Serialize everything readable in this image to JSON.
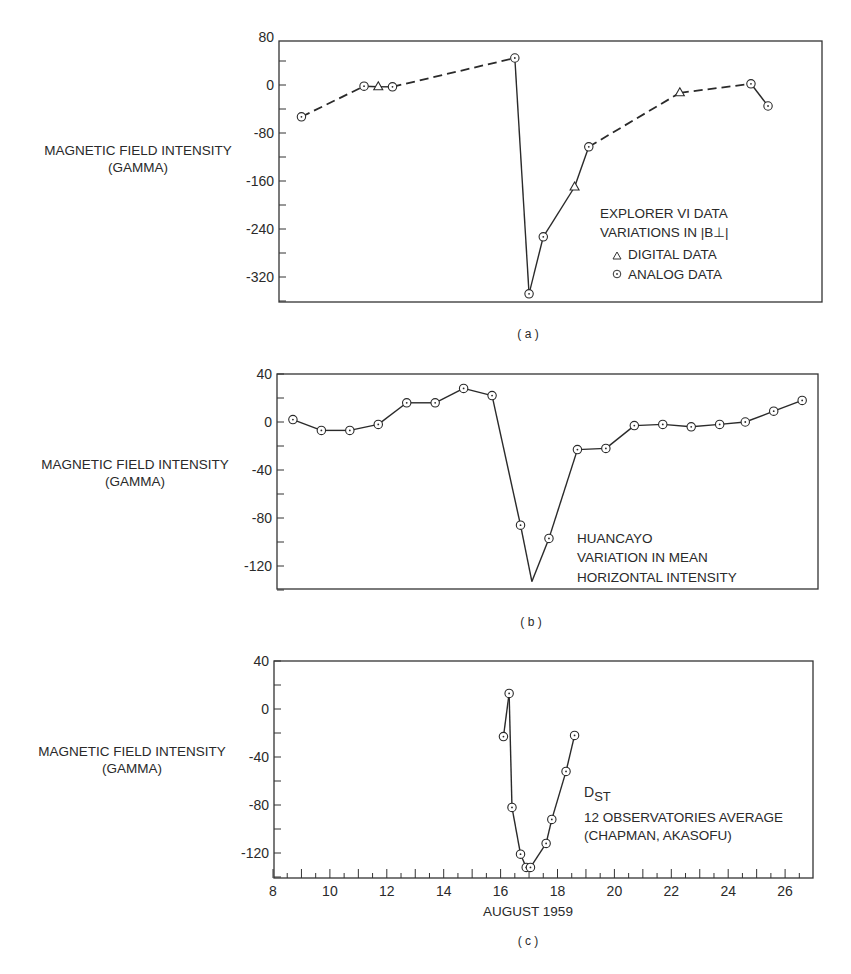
{
  "figure": {
    "x_axis_label": "AUGUST 1959",
    "x_ticks": [
      8,
      10,
      12,
      14,
      16,
      18,
      20,
      22,
      24,
      26
    ],
    "ylabel_line1": "MAGNETIC FIELD INTENSITY",
    "ylabel_line2": "(GAMMA)"
  },
  "panels": [
    {
      "id": "a",
      "caption": "( a )",
      "legend": {
        "line1": "EXPLORER VI DATA",
        "line2": "VARIATIONS IN |B⊥|",
        "digital_label": "DIGITAL DATA",
        "analog_label": "ANALOG DATA"
      }
    },
    {
      "id": "b",
      "caption": "( b )",
      "legend": {
        "line1": "HUANCAYO",
        "line2": "VARIATION IN MEAN",
        "line3": "HORIZONTAL INTENSITY"
      }
    },
    {
      "id": "c",
      "caption": "( c )",
      "legend": {
        "line1": "D",
        "line1_sub": "ST",
        "line2": "12 OBSERVATORIES AVERAGE",
        "line3": "(CHAPMAN, AKASOFU)"
      }
    }
  ],
  "chart_data": [
    {
      "type": "line",
      "title": "(a) Explorer VI data — variations in |B⊥|",
      "xlabel": "",
      "ylabel": "MAGNETIC FIELD INTENSITY (GAMMA)",
      "xlim": [
        8,
        27
      ],
      "ylim": [
        -360,
        80
      ],
      "yticks": [
        80,
        0,
        -80,
        -160,
        -240,
        -320
      ],
      "grid": false,
      "legend_position": "lower right inside",
      "series": [
        {
          "name": "Explorer VI |B⊥|",
          "points": [
            {
              "x": 9.0,
              "y": -53,
              "marker": "analog"
            },
            {
              "x": 11.2,
              "y": -2,
              "marker": "analog"
            },
            {
              "x": 11.7,
              "y": -3,
              "marker": "digital"
            },
            {
              "x": 12.2,
              "y": -3,
              "marker": "analog"
            },
            {
              "x": 16.5,
              "y": 45,
              "marker": "analog"
            },
            {
              "x": 17.0,
              "y": -348,
              "marker": "analog"
            },
            {
              "x": 17.5,
              "y": -253,
              "marker": "analog"
            },
            {
              "x": 18.6,
              "y": -170,
              "marker": "digital"
            },
            {
              "x": 19.1,
              "y": -103,
              "marker": "analog"
            },
            {
              "x": 22.3,
              "y": -13,
              "marker": "digital"
            },
            {
              "x": 24.8,
              "y": 2,
              "marker": "analog"
            },
            {
              "x": 25.4,
              "y": -35,
              "marker": "analog"
            }
          ],
          "segments": [
            {
              "from": 0,
              "to": 1,
              "style": "dashed"
            },
            {
              "from": 1,
              "to": 2,
              "style": "solid"
            },
            {
              "from": 2,
              "to": 3,
              "style": "solid"
            },
            {
              "from": 3,
              "to": 4,
              "style": "dashed"
            },
            {
              "from": 4,
              "to": 5,
              "style": "solid"
            },
            {
              "from": 5,
              "to": 6,
              "style": "solid"
            },
            {
              "from": 6,
              "to": 7,
              "style": "solid"
            },
            {
              "from": 7,
              "to": 8,
              "style": "solid"
            },
            {
              "from": 8,
              "to": 9,
              "style": "dashed"
            },
            {
              "from": 9,
              "to": 10,
              "style": "dashed"
            },
            {
              "from": 10,
              "to": 11,
              "style": "solid"
            }
          ]
        }
      ]
    },
    {
      "type": "line",
      "title": "(b) Huancayo variation in mean horizontal intensity",
      "xlabel": "",
      "ylabel": "MAGNETIC FIELD INTENSITY (GAMMA)",
      "xlim": [
        8,
        27
      ],
      "ylim": [
        -140,
        40
      ],
      "yticks": [
        40,
        0,
        -40,
        -80,
        -120
      ],
      "grid": false,
      "series": [
        {
          "name": "Huancayo H",
          "points": [
            {
              "x": 8.7,
              "y": 2,
              "marker": "analog"
            },
            {
              "x": 9.7,
              "y": -7,
              "marker": "analog"
            },
            {
              "x": 10.7,
              "y": -7,
              "marker": "analog"
            },
            {
              "x": 11.7,
              "y": -2,
              "marker": "analog"
            },
            {
              "x": 12.7,
              "y": 16,
              "marker": "analog"
            },
            {
              "x": 13.7,
              "y": 16,
              "marker": "analog"
            },
            {
              "x": 14.7,
              "y": 28,
              "marker": "analog"
            },
            {
              "x": 15.7,
              "y": 22,
              "marker": "analog"
            },
            {
              "x": 16.7,
              "y": -86,
              "marker": "analog"
            },
            {
              "x": 17.1,
              "y": -133,
              "marker": "none"
            },
            {
              "x": 17.7,
              "y": -97,
              "marker": "analog"
            },
            {
              "x": 18.7,
              "y": -23,
              "marker": "analog"
            },
            {
              "x": 19.7,
              "y": -22,
              "marker": "analog"
            },
            {
              "x": 20.7,
              "y": -3,
              "marker": "analog"
            },
            {
              "x": 21.7,
              "y": -2,
              "marker": "analog"
            },
            {
              "x": 22.7,
              "y": -4,
              "marker": "analog"
            },
            {
              "x": 23.7,
              "y": -2,
              "marker": "analog"
            },
            {
              "x": 24.6,
              "y": 0,
              "marker": "analog"
            },
            {
              "x": 25.6,
              "y": 9,
              "marker": "analog"
            },
            {
              "x": 26.6,
              "y": 18,
              "marker": "analog"
            }
          ]
        }
      ]
    },
    {
      "type": "line",
      "title": "(c) Dst — 12 observatories average (Chapman, Akasofu)",
      "xlabel": "AUGUST 1959",
      "ylabel": "MAGNETIC FIELD INTENSITY (GAMMA)",
      "xlim": [
        8,
        27
      ],
      "ylim": [
        -140,
        40
      ],
      "xticks": [
        8,
        10,
        12,
        14,
        16,
        18,
        20,
        22,
        24,
        26
      ],
      "yticks": [
        40,
        0,
        -40,
        -80,
        -120
      ],
      "grid": false,
      "series": [
        {
          "name": "Dst",
          "points": [
            {
              "x": 16.1,
              "y": -23,
              "marker": "analog"
            },
            {
              "x": 16.3,
              "y": 13,
              "marker": "analog"
            },
            {
              "x": 16.4,
              "y": -82,
              "marker": "analog"
            },
            {
              "x": 16.7,
              "y": -121,
              "marker": "analog"
            },
            {
              "x": 16.9,
              "y": -132,
              "marker": "analog"
            },
            {
              "x": 17.05,
              "y": -132,
              "marker": "analog"
            },
            {
              "x": 17.6,
              "y": -112,
              "marker": "analog"
            },
            {
              "x": 17.8,
              "y": -92,
              "marker": "analog"
            },
            {
              "x": 18.3,
              "y": -52,
              "marker": "analog"
            },
            {
              "x": 18.6,
              "y": -22,
              "marker": "analog"
            }
          ]
        }
      ]
    }
  ]
}
